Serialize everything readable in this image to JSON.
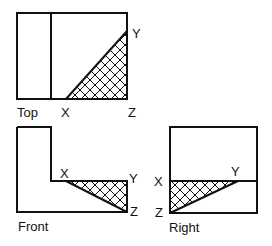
{
  "views": {
    "top": {
      "name": "Top",
      "points": {
        "x": "X",
        "y": "Y",
        "z": "Z"
      }
    },
    "front": {
      "name": "Front",
      "points": {
        "x": "X",
        "y": "Y",
        "z": "Z"
      }
    },
    "right": {
      "name": "Right",
      "points": {
        "x": "X",
        "y": "Y",
        "z": "Z"
      }
    }
  },
  "style": {
    "line_color": "#111111",
    "background": "#ffffff",
    "hatch": "crosshatch"
  }
}
